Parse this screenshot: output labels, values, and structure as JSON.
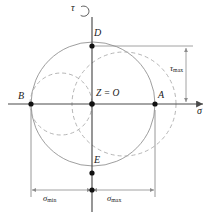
{
  "figure": {
    "type": "mohr-circle-diagram",
    "canvas": {
      "width": 215,
      "height": 215,
      "background": "#ffffff"
    },
    "colors": {
      "axis": "#4a4a4a",
      "solid_circle": "#8c8c8c",
      "dashed_circle": "#a8a8a8",
      "dimension_line": "#8c8c8c",
      "point_fill": "#111111",
      "text": "#1a1a1a"
    },
    "axes": {
      "horizontal": {
        "name": "sigma-axis",
        "label": "σ",
        "y": 104,
        "x_start": 8,
        "x_end": 205,
        "arrow": "right"
      },
      "vertical": {
        "name": "tau-axis",
        "label": "τ",
        "x": 92,
        "y_start": 16,
        "y_end": 212,
        "arrow": "up",
        "rotation_marker": true
      }
    },
    "origin": {
      "x": 92,
      "y": 104,
      "label_prefix": "Z",
      "label_equals": "=",
      "label_suffix": "O",
      "label": "Z = O"
    },
    "points": [
      {
        "name": "point-B",
        "label": "B",
        "x": 31,
        "y": 104,
        "label_dx": -12,
        "label_dy": -12
      },
      {
        "name": "point-A",
        "label": "A",
        "x": 155,
        "y": 104,
        "label_dx": 4,
        "label_dy": -13
      },
      {
        "name": "point-D",
        "label": "D",
        "x": 92,
        "y": 46,
        "label_dx": 3,
        "label_dy": -17
      },
      {
        "name": "point-E",
        "label": "E",
        "x": 92,
        "y": 173,
        "label_dx": 3,
        "label_dy": -17
      },
      {
        "name": "point-origin",
        "label": "",
        "x": 92,
        "y": 104,
        "label_dx": 0,
        "label_dy": 0
      },
      {
        "name": "point-dim-origin",
        "label": "",
        "x": 92,
        "y": 190,
        "label_dx": 0,
        "label_dy": 0
      }
    ],
    "circles": [
      {
        "name": "principal-circle-outer",
        "style": "solid",
        "cx": 93,
        "cy": 104,
        "r": 62
      },
      {
        "name": "principal-circle-left-dashed",
        "style": "dashed",
        "cx": 61,
        "cy": 104,
        "r": 31
      },
      {
        "name": "principal-circle-right-dashed",
        "style": "dashed",
        "cx": 124,
        "cy": 104,
        "r": 52
      }
    ],
    "dimensions": [
      {
        "name": "tau-max-dimension",
        "label": "τ",
        "subscript": "max",
        "orientation": "vertical",
        "x": 186,
        "y_top": 46,
        "y_bottom": 104,
        "label_x": 170,
        "label_y": 66,
        "leader_from_x": 92,
        "leader_from_y": 46,
        "leader_to_x": 193
      },
      {
        "name": "sigma-min-dimension",
        "label": "σ",
        "subscript": "min",
        "orientation": "horizontal",
        "y": 190,
        "x_left": 31,
        "x_right": 92,
        "label_x": 44,
        "label_y": 195
      },
      {
        "name": "sigma-max-dimension",
        "label": "σ",
        "subscript": "max",
        "orientation": "horizontal",
        "y": 190,
        "x_left": 92,
        "x_right": 155,
        "label_x": 108,
        "label_y": 195
      }
    ],
    "extension_lines": [
      {
        "name": "extension-line-B",
        "x": 31,
        "y_top": 110,
        "y_bottom": 197
      },
      {
        "name": "extension-line-A",
        "x": 155,
        "y_top": 110,
        "y_bottom": 197
      }
    ]
  }
}
